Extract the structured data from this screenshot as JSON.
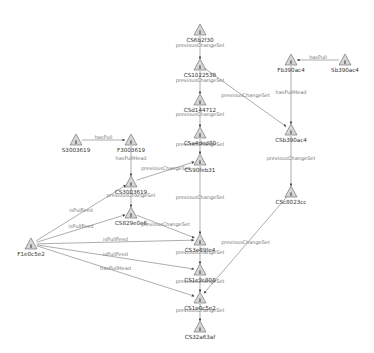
{
  "diagram": {
    "type": "directed-graph",
    "nodes": [
      {
        "id": "CS6b2f30",
        "label": "CS6b2f30",
        "x": 200,
        "y": 30
      },
      {
        "id": "CS1022538",
        "label": "CS1022538",
        "x": 200,
        "y": 65
      },
      {
        "id": "CSd144712",
        "label": "CSd144712",
        "x": 200,
        "y": 100
      },
      {
        "id": "CSa4ded80",
        "label": "CSa4ded80",
        "x": 200,
        "y": 133
      },
      {
        "id": "CS90feb31",
        "label": "CS90feb31",
        "x": 200,
        "y": 160
      },
      {
        "id": "Fb390ac4",
        "label": "Fb390ac4",
        "x": 291,
        "y": 60
      },
      {
        "id": "Sb390ac4",
        "label": "Sb390ac4",
        "x": 345,
        "y": 60
      },
      {
        "id": "CSb390ac4",
        "label": "CSb390ac4",
        "x": 291,
        "y": 130
      },
      {
        "id": "CSc8023cc",
        "label": "CSc8023cc",
        "x": 291,
        "y": 192
      },
      {
        "id": "S3003619",
        "label": "S3003619",
        "x": 76,
        "y": 140
      },
      {
        "id": "F3003619",
        "label": "F3003619",
        "x": 131,
        "y": 140
      },
      {
        "id": "CS3003619",
        "label": "CS3003619",
        "x": 131,
        "y": 182
      },
      {
        "id": "CS829e0e6",
        "label": "CS829e0e6",
        "x": 131,
        "y": 213
      },
      {
        "id": "F1e0c5e2",
        "label": "F1e0c5e2",
        "x": 31,
        "y": 244
      },
      {
        "id": "CS3e89fe4",
        "label": "CS3e89fe4",
        "x": 200,
        "y": 240
      },
      {
        "id": "CS1c2c808",
        "label": "CS1c2c808",
        "x": 200,
        "y": 270
      },
      {
        "id": "CS1e0c5e2",
        "label": "CS1e0c5e2",
        "x": 200,
        "y": 298
      },
      {
        "id": "CS32a63af",
        "label": "CS32a63af",
        "x": 200,
        "y": 327
      }
    ],
    "edges": [
      {
        "from": "CS6b2f30",
        "to": "CS1022538",
        "label": "previousChangeSet"
      },
      {
        "from": "CS1022538",
        "to": "CSd144712",
        "label": "previousChangeSet"
      },
      {
        "from": "CS1022538",
        "to": "CSb390ac4",
        "label": "previousChangeSet"
      },
      {
        "from": "CSd144712",
        "to": "CSa4ded80",
        "label": "previousChangeSet"
      },
      {
        "from": "CSa4ded80",
        "to": "CS90feb31",
        "label": "previousChangeSet"
      },
      {
        "from": "Sb390ac4",
        "to": "Fb390ac4",
        "label": "hasPull"
      },
      {
        "from": "Fb390ac4",
        "to": "CSb390ac4",
        "label": "hasPullHead"
      },
      {
        "from": "CSb390ac4",
        "to": "CSc8023cc",
        "label": "previousChangeSet"
      },
      {
        "from": "CSc8023cc",
        "to": "CS1e0c5e2",
        "label": "previousChangeSet"
      },
      {
        "from": "S3003619",
        "to": "F3003619",
        "label": "hasPull"
      },
      {
        "from": "F3003619",
        "to": "CS3003619",
        "label": "hasPullHead"
      },
      {
        "from": "CS3003619",
        "to": "CS90feb31",
        "label": "previousChangeSet"
      },
      {
        "from": "CS3003619",
        "to": "CS829e0e6",
        "label": "previousChangeSet"
      },
      {
        "from": "CS829e0e6",
        "to": "CS3e89fe4",
        "label": "previousChangeSet"
      },
      {
        "from": "CS90feb31",
        "to": "CS3e89fe4",
        "label": "previousChangeSet"
      },
      {
        "from": "F1e0c5e2",
        "to": "CS3003619",
        "label": "isPulFeed"
      },
      {
        "from": "F1e0c5e2",
        "to": "CS829e0e6",
        "label": "isPullFeed"
      },
      {
        "from": "F1e0c5e2",
        "to": "CS3e89fe4",
        "label": "isPullFeed"
      },
      {
        "from": "F1e0c5e2",
        "to": "CS1c2c808",
        "label": "isPullFeed"
      },
      {
        "from": "F1e0c5e2",
        "to": "CS1e0c5e2",
        "label": "hasPullHead"
      },
      {
        "from": "CS3e89fe4",
        "to": "CS1c2c808",
        "label": "previousChangeSet"
      },
      {
        "from": "CS1c2c808",
        "to": "CS1e0c5e2",
        "label": "previousChangeSet"
      },
      {
        "from": "CS1e0c5e2",
        "to": "CS32a63af",
        "label": "previousChangeSet"
      }
    ]
  }
}
